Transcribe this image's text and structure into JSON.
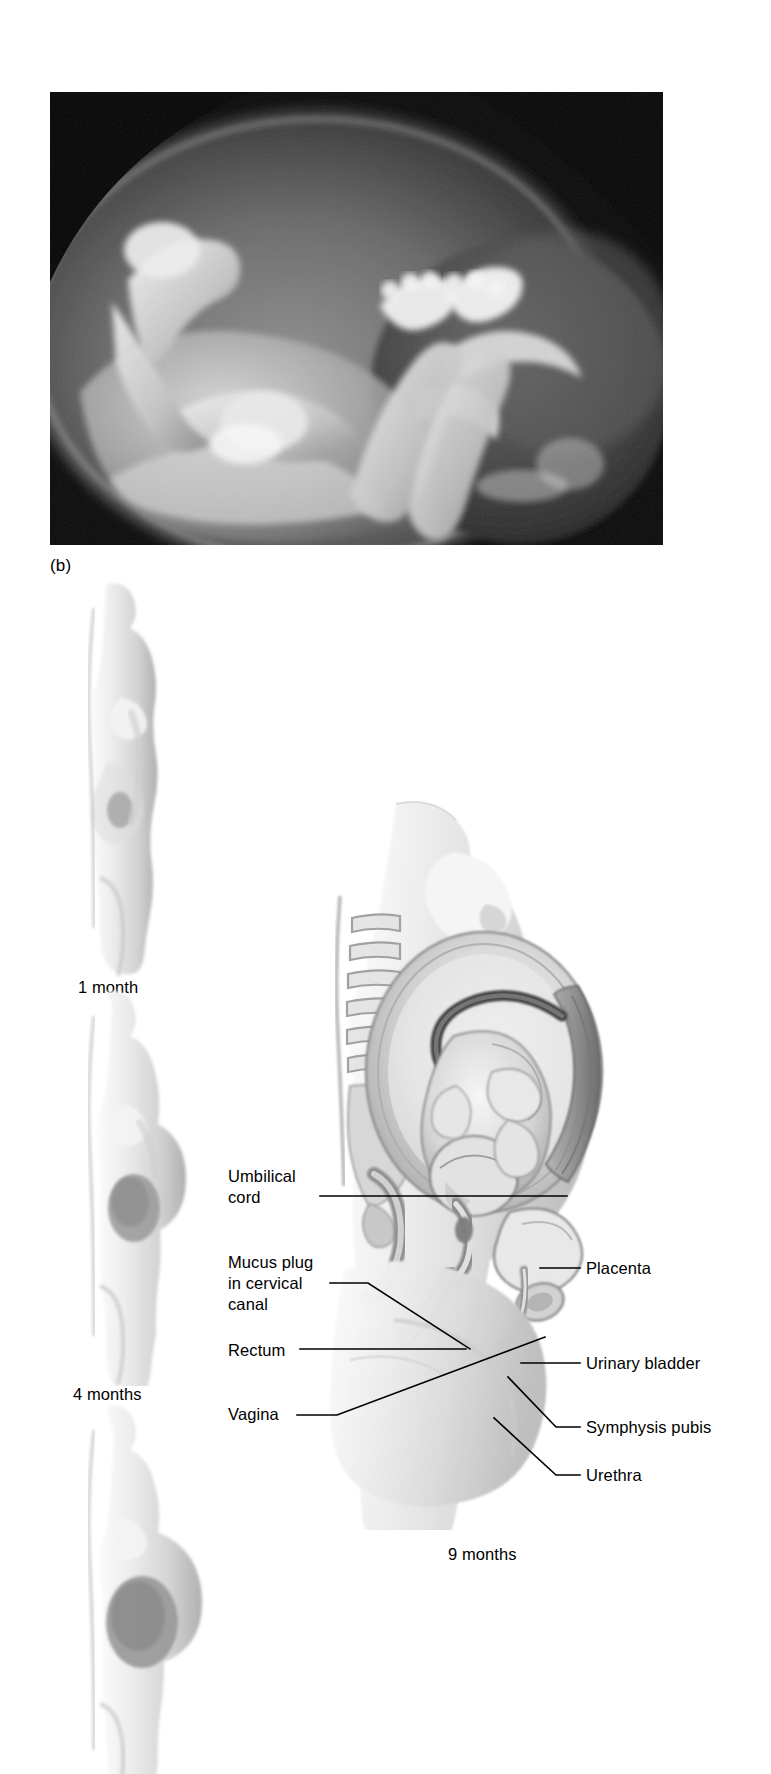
{
  "figure": {
    "panel_letter": "(b)",
    "photo": {
      "alt_name": "fetus-in-amniotic-sac-photograph",
      "description": "Black and white photograph of a fetus curled within the amniotic sac"
    }
  },
  "stages": [
    {
      "caption": "1 month"
    },
    {
      "caption": "4 months"
    },
    {
      "caption": "9 months"
    }
  ],
  "labels": {
    "left": [
      {
        "id": "umbilical-cord",
        "text": "Umbilical\ncord"
      },
      {
        "id": "mucus-plug",
        "text": "Mucus plug\nin cervical\ncanal"
      },
      {
        "id": "rectum",
        "text": "Rectum"
      },
      {
        "id": "vagina",
        "text": "Vagina"
      }
    ],
    "right": [
      {
        "id": "placenta",
        "text": "Placenta"
      },
      {
        "id": "urinary-bladder",
        "text": "Urinary bladder"
      },
      {
        "id": "symphysis-pubis",
        "text": "Symphysis pubis"
      },
      {
        "id": "urethra",
        "text": "Urethra"
      }
    ]
  },
  "colors": {
    "ink": "#000000",
    "page": "#ffffff",
    "photo_dark": "#0a0a0a",
    "tissue_light": "#e6e6e6",
    "tissue_mid": "#c9c9c9",
    "tissue_dark": "#9a9a9a",
    "outline": "#6f6f6f"
  }
}
